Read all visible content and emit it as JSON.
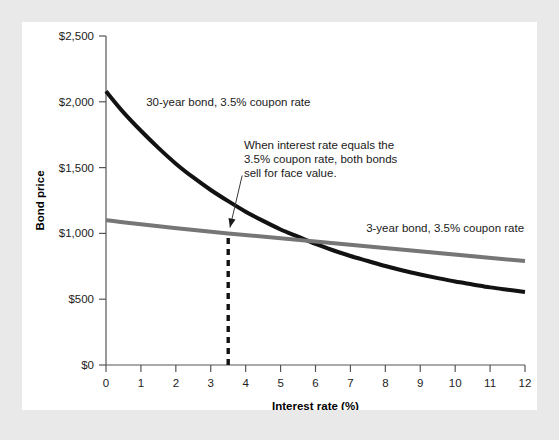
{
  "chart_data": {
    "type": "line",
    "title": "",
    "xlabel": "Interest rate (%)",
    "ylabel": "Bond price",
    "xlim": [
      0,
      12
    ],
    "ylim": [
      0,
      2500
    ],
    "xticks": [
      "0",
      "1",
      "2",
      "3",
      "4",
      "5",
      "6",
      "7",
      "8",
      "9",
      "10",
      "11",
      "12"
    ],
    "xtick_values": [
      0,
      1,
      2,
      3,
      4,
      5,
      6,
      7,
      8,
      9,
      10,
      11,
      12
    ],
    "yticks": [
      "$0",
      "$500",
      "$1,000",
      "$1,500",
      "$2,000",
      "$2,500"
    ],
    "ytick_values": [
      0,
      500,
      1000,
      1500,
      2000,
      2500
    ],
    "grid": false,
    "legend_position": "inline-labels",
    "series": [
      {
        "name": "30-year bond, 3.5% coupon rate",
        "color": "#121212",
        "width": 4,
        "x": [
          0,
          0.5,
          1,
          1.5,
          2,
          2.5,
          3,
          3.5,
          4,
          4.5,
          5,
          5.5,
          6,
          6.5,
          7,
          7.5,
          8,
          8.5,
          9,
          9.5,
          10,
          10.5,
          11,
          11.5,
          12
        ],
        "values": [
          2080,
          1920,
          1780,
          1650,
          1530,
          1425,
          1330,
          1245,
          1165,
          1095,
          1030,
          975,
          920,
          872,
          828,
          790,
          752,
          718,
          688,
          660,
          634,
          612,
          590,
          572,
          555
        ]
      },
      {
        "name": "3-year bond, 3.5% coupon rate",
        "color": "#767676",
        "width": 4,
        "x": [
          0,
          3.5,
          12
        ],
        "values": [
          1100,
          1000,
          790
        ]
      }
    ],
    "series_labels": [
      {
        "text": "30-year bond, 3.5% coupon rate",
        "x": 1.15,
        "y": 1965
      },
      {
        "text": "3-year bond, 3.5% coupon rate",
        "x": 7.45,
        "y": 1010
      }
    ],
    "annotation": {
      "lines": [
        "When interest rate equals the",
        "3.5% coupon rate, both bonds",
        "sell for face value."
      ],
      "text_x": 3.95,
      "text_y": 1640,
      "arrow_from_x": 3.9,
      "arrow_from_y": 1440,
      "arrow_to_x": 3.55,
      "arrow_to_y": 1045
    },
    "marker_line": {
      "label": "intersection at 3.5%",
      "x": 3.5,
      "y_from": 0,
      "y_to": 1000,
      "style": "dashed",
      "color": "#121212"
    },
    "intersection_point": {
      "x": 3.5,
      "y": 1000
    }
  },
  "figure": {
    "background_color": "#e9e9e9",
    "panel_color": "#ffffff"
  }
}
